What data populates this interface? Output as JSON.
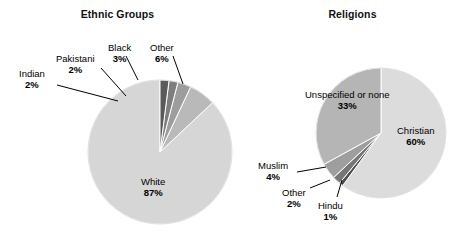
{
  "figure": {
    "background": "#ffffff",
    "width": 470,
    "height": 245
  },
  "charts": [
    {
      "id": "ethnic-groups",
      "title": "Ethnic Groups",
      "type": "pie",
      "center": [
        160,
        152
      ],
      "radius": 72,
      "start_angle_deg": -90,
      "direction": "counterclockwise",
      "categories": [
        "White",
        "Other",
        "Black",
        "Pakistani",
        "Indian"
      ],
      "values": [
        87,
        6,
        3,
        2,
        2
      ],
      "value_labels": [
        "87%",
        "6%",
        "3%",
        "2%",
        "2%"
      ],
      "colors": [
        "#d6d6d6",
        "#b9b9b9",
        "#9d9d9d",
        "#7e7e7e",
        "#5a5a5a"
      ],
      "labels": [
        {
          "name": "White",
          "pct": "87%",
          "align": "center",
          "left": 141,
          "top": 176
        },
        {
          "name": "Other",
          "pct": "6%",
          "align": "center",
          "left": 150,
          "top": 42
        },
        {
          "name": "Black",
          "pct": "3%",
          "align": "center",
          "left": 108,
          "top": 42
        },
        {
          "name": "Pakistani",
          "pct": "2%",
          "align": "center",
          "left": 56,
          "top": 53
        },
        {
          "name": "Indian",
          "pct": "2%",
          "align": "center",
          "left": 19,
          "top": 68
        }
      ],
      "leaders": [
        {
          "name": "other-leader",
          "points": "173,56 183,84"
        },
        {
          "name": "black-leader",
          "points": "126,56 138,80"
        },
        {
          "name": "pakistani-leader",
          "points": "101,68 126,96"
        },
        {
          "name": "indian-leader",
          "points": "57,85 118,101"
        }
      ]
    },
    {
      "id": "religions",
      "title": "Religions",
      "type": "pie",
      "center": [
        381,
        133
      ],
      "radius": 65,
      "start_angle_deg": -90,
      "direction": "clockwise",
      "categories": [
        "Christian",
        "Hindu",
        "Other",
        "Muslim",
        "Unspecified or none"
      ],
      "values": [
        60,
        1,
        2,
        4,
        33
      ],
      "value_labels": [
        "60%",
        "1%",
        "2%",
        "4%",
        "33%"
      ],
      "colors": [
        "#dcdcdc",
        "#4f4f4f",
        "#767676",
        "#9e9e9e",
        "#b5b5b5"
      ],
      "labels": [
        {
          "name": "Christian",
          "pct": "60%",
          "align": "center",
          "left": 397,
          "top": 125
        },
        {
          "name": "Unspecified or none",
          "pct": "33%",
          "align": "center",
          "left": 305,
          "top": 89
        },
        {
          "name": "Muslim",
          "pct": "4%",
          "align": "center",
          "left": 258,
          "top": 160
        },
        {
          "name": "Other",
          "pct": "2%",
          "align": "center",
          "left": 282,
          "top": 187
        },
        {
          "name": "Hindu",
          "pct": "1%",
          "align": "center",
          "left": 318,
          "top": 200
        }
      ],
      "leaders": [
        {
          "name": "muslim-leader",
          "points": "297,172 326,167"
        },
        {
          "name": "other-leader",
          "points": "310,188 330,180"
        },
        {
          "name": "hindu-leader",
          "points": "337,197 342,180"
        }
      ]
    }
  ],
  "chart_data": [
    {
      "type": "pie",
      "title": "Ethnic Groups",
      "categories": [
        "White",
        "Other",
        "Black",
        "Pakistani",
        "Indian"
      ],
      "values": [
        87,
        6,
        3,
        2,
        2
      ],
      "unit": "percent",
      "legend": "none (direct labels with leader lines)",
      "grid": false
    },
    {
      "type": "pie",
      "title": "Religions",
      "categories": [
        "Christian",
        "Unspecified or none",
        "Muslim",
        "Other",
        "Hindu"
      ],
      "values": [
        60,
        33,
        4,
        2,
        1
      ],
      "unit": "percent",
      "legend": "none (direct labels with leader lines)",
      "grid": false
    }
  ]
}
